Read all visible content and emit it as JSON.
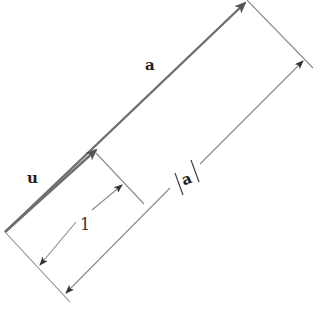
{
  "diagram": {
    "labels": {
      "vector_a": "a",
      "vector_u": "u",
      "unit_length": "1",
      "magnitude": "a"
    },
    "colors": {
      "vector_stroke": "#6e6e6e",
      "guide_stroke": "#8a8a8a",
      "arrowhead": "#555555",
      "text": "#222222",
      "background": "#ffffff"
    },
    "geometry": {
      "origin": [
        5,
        232
      ],
      "u_tip": [
        98,
        152
      ],
      "a_tip": [
        245,
        2
      ],
      "direction_angle_deg": -41
    }
  }
}
